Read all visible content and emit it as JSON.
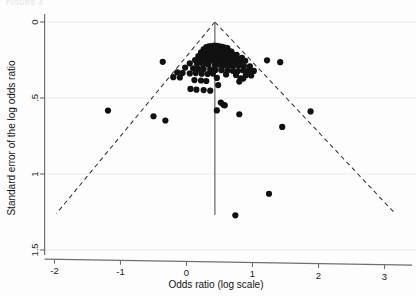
{
  "figure": {
    "top_artifact_text": "FIGURE 4",
    "background_color": "#fdfdfd",
    "point_color": "#111111",
    "axis_color": "#6f6f6f",
    "gridline_color": "#f1f1f1",
    "funnel_line_color": "#333333",
    "center_line_color": "#555555"
  },
  "chart_data": {
    "type": "scatter",
    "title": "",
    "subtitle": "",
    "xlabel": "Odds ratio (log scale)",
    "ylabel": "Standard error of the log odds ratio",
    "xlim": [
      -2.15,
      3.25
    ],
    "ylim": [
      0,
      1.52
    ],
    "y_inverted": true,
    "xticks": [
      -2,
      -1,
      0,
      1,
      2,
      3
    ],
    "xtick_labels": [
      "-2",
      "-1",
      "0",
      "1",
      "2",
      "3"
    ],
    "yticks": [
      0,
      0.5,
      1,
      1.5
    ],
    "ytick_labels": [
      "0",
      ".5",
      "1",
      "1.5"
    ],
    "grid": "horizontal-faint",
    "legend": "none",
    "annotations": [
      {
        "name": "pooled-effect-line",
        "type": "vline",
        "x": 0.43,
        "y_from": 0.0,
        "y_to": 1.27,
        "style": "solid"
      },
      {
        "name": "funnel-left-limit",
        "type": "line",
        "points": [
          [
            0.43,
            0.0
          ],
          [
            -1.97,
            1.26
          ]
        ],
        "style": "dashed"
      },
      {
        "name": "funnel-right-limit",
        "type": "line",
        "points": [
          [
            0.43,
            0.0
          ],
          [
            3.16,
            1.26
          ]
        ],
        "style": "dashed"
      }
    ],
    "series": [
      {
        "name": "studies",
        "marker": "filled-circle",
        "marker_size": 3.1,
        "color": "#111111",
        "n_points": 116,
        "points": [
          [
            0.3,
            0.165
          ],
          [
            0.34,
            0.16
          ],
          [
            0.38,
            0.158
          ],
          [
            0.42,
            0.155
          ],
          [
            0.46,
            0.157
          ],
          [
            0.5,
            0.16
          ],
          [
            0.54,
            0.163
          ],
          [
            0.58,
            0.168
          ],
          [
            0.62,
            0.172
          ],
          [
            0.26,
            0.18
          ],
          [
            0.31,
            0.183
          ],
          [
            0.36,
            0.178
          ],
          [
            0.4,
            0.176
          ],
          [
            0.44,
            0.174
          ],
          [
            0.48,
            0.178
          ],
          [
            0.52,
            0.181
          ],
          [
            0.56,
            0.184
          ],
          [
            0.6,
            0.186
          ],
          [
            0.64,
            0.19
          ],
          [
            0.68,
            0.195
          ],
          [
            0.22,
            0.2
          ],
          [
            0.27,
            0.198
          ],
          [
            0.33,
            0.196
          ],
          [
            0.37,
            0.199
          ],
          [
            0.41,
            0.202
          ],
          [
            0.45,
            0.2
          ],
          [
            0.49,
            0.203
          ],
          [
            0.53,
            0.205
          ],
          [
            0.57,
            0.207
          ],
          [
            0.61,
            0.21
          ],
          [
            0.66,
            0.212
          ],
          [
            0.71,
            0.214
          ],
          [
            0.76,
            0.216
          ],
          [
            0.18,
            0.225
          ],
          [
            0.24,
            0.222
          ],
          [
            0.29,
            0.22
          ],
          [
            0.35,
            0.224
          ],
          [
            0.39,
            0.228
          ],
          [
            0.43,
            0.226
          ],
          [
            0.47,
            0.229
          ],
          [
            0.51,
            0.231
          ],
          [
            0.55,
            0.233
          ],
          [
            0.59,
            0.235
          ],
          [
            0.63,
            0.237
          ],
          [
            0.67,
            0.239
          ],
          [
            0.72,
            0.241
          ],
          [
            0.78,
            0.243
          ],
          [
            0.84,
            0.236
          ],
          [
            0.13,
            0.25
          ],
          [
            0.2,
            0.252
          ],
          [
            0.28,
            0.248
          ],
          [
            0.34,
            0.252
          ],
          [
            0.4,
            0.255
          ],
          [
            0.46,
            0.253
          ],
          [
            0.52,
            0.256
          ],
          [
            0.58,
            0.258
          ],
          [
            0.64,
            0.26
          ],
          [
            0.7,
            0.262
          ],
          [
            0.76,
            0.257
          ],
          [
            0.82,
            0.259
          ],
          [
            0.89,
            0.255
          ],
          [
            -0.36,
            0.262
          ],
          [
            1.42,
            0.264
          ],
          [
            1.22,
            0.252
          ],
          [
            0.05,
            0.272
          ],
          [
            0.16,
            0.275
          ],
          [
            0.25,
            0.278
          ],
          [
            0.33,
            0.28
          ],
          [
            0.43,
            0.283
          ],
          [
            0.5,
            0.281
          ],
          [
            0.57,
            0.285
          ],
          [
            0.64,
            0.287
          ],
          [
            0.71,
            0.289
          ],
          [
            0.79,
            0.286
          ],
          [
            0.87,
            0.29
          ],
          [
            0.96,
            0.292
          ],
          [
            -0.02,
            0.3
          ],
          [
            0.1,
            0.305
          ],
          [
            0.18,
            0.308
          ],
          [
            0.26,
            0.31
          ],
          [
            0.36,
            0.312
          ],
          [
            0.44,
            0.315
          ],
          [
            0.53,
            0.317
          ],
          [
            0.62,
            0.319
          ],
          [
            0.7,
            0.321
          ],
          [
            0.78,
            0.323
          ],
          [
            0.86,
            0.318
          ],
          [
            0.94,
            0.32
          ],
          [
            1.02,
            0.322
          ],
          [
            -0.14,
            0.332
          ],
          [
            -0.06,
            0.335
          ],
          [
            0.05,
            0.338
          ],
          [
            0.14,
            0.336
          ],
          [
            0.23,
            0.34
          ],
          [
            0.32,
            0.342
          ],
          [
            0.4,
            0.339
          ],
          [
            0.6,
            0.345
          ],
          [
            0.75,
            0.348
          ],
          [
            0.9,
            0.35
          ],
          [
            0.98,
            0.352
          ],
          [
            -0.2,
            0.363
          ],
          [
            -0.1,
            0.365
          ],
          [
            0.46,
            0.368
          ],
          [
            0.82,
            0.37
          ],
          [
            0.86,
            0.372
          ],
          [
            0.12,
            0.382
          ],
          [
            0.22,
            0.385
          ],
          [
            0.3,
            0.388
          ],
          [
            0.8,
            0.392
          ],
          [
            0.48,
            0.415
          ],
          [
            0.06,
            0.44
          ],
          [
            0.15,
            0.445
          ],
          [
            0.26,
            0.448
          ],
          [
            0.36,
            0.452
          ],
          [
            0.52,
            0.53
          ],
          [
            0.56,
            0.545
          ],
          [
            0.58,
            0.548
          ],
          [
            -1.19,
            0.583
          ],
          [
            0.46,
            0.582
          ],
          [
            0.8,
            0.607
          ],
          [
            -0.5,
            0.62
          ],
          [
            1.88,
            0.588
          ],
          [
            -0.32,
            0.648
          ],
          [
            1.45,
            0.69
          ],
          [
            1.25,
            1.13
          ],
          [
            0.74,
            1.272
          ]
        ]
      }
    ]
  },
  "axes": {
    "x_axis_name": "x-axis",
    "y_axis_name": "y-axis",
    "x_title": "Odds ratio (log scale)",
    "y_title": "Standard error of the log odds ratio"
  }
}
